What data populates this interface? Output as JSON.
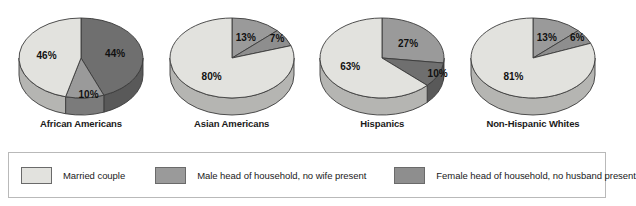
{
  "chart_data": {
    "type": "pie",
    "title": "",
    "layout": "four small-multiple 3D pie charts in a row with a shared legend below",
    "legend_position": "bottom",
    "grid": false,
    "value_format": "percent",
    "categories": [
      "Married couple",
      "Male head of household, no wife present",
      "Female head of household, no husband present"
    ],
    "category_colors": [
      "#e2e2de",
      "#9a9a9a",
      "#6f6f6f"
    ],
    "charts": [
      {
        "label": "African Americans",
        "slices": [
          {
            "category": "Female head of household, no husband present",
            "value": 44,
            "label": "44%",
            "color": "#6f6f6f"
          },
          {
            "category": "Male head of household, no wife present",
            "value": 10,
            "label": "10%",
            "color": "#9a9a9a"
          },
          {
            "category": "Married couple",
            "value": 46,
            "label": "46%",
            "color": "#e2e2de"
          }
        ]
      },
      {
        "label": "Asian Americans",
        "slices": [
          {
            "category": "Male head of household, no wife present",
            "value": 13,
            "label": "13%",
            "color": "#9a9a9a"
          },
          {
            "category": "Female head of household, no husband present",
            "value": 7,
            "label": "7%",
            "color": "#8e8e8e"
          },
          {
            "category": "Married couple",
            "value": 80,
            "label": "80%",
            "color": "#e2e2de"
          }
        ]
      },
      {
        "label": "Hispanics",
        "slices": [
          {
            "category": "Male head of household, no wife present",
            "value": 27,
            "label": "27%",
            "color": "#9a9a9a"
          },
          {
            "category": "Female head of household, no husband present",
            "value": 10,
            "label": "10%",
            "color": "#6f6f6f"
          },
          {
            "category": "Married couple",
            "value": 63,
            "label": "63%",
            "color": "#e2e2de"
          }
        ]
      },
      {
        "label": "Non-Hispanic Whites",
        "slices": [
          {
            "category": "Male head of household, no wife present",
            "value": 13,
            "label": "13%",
            "color": "#9a9a9a"
          },
          {
            "category": "Female head of household, no husband present",
            "value": 6,
            "label": "6%",
            "color": "#8e8e8e"
          },
          {
            "category": "Married couple",
            "value": 81,
            "label": "81%",
            "color": "#e2e2de"
          }
        ]
      }
    ]
  },
  "legend": {
    "items": [
      {
        "label": "Married couple",
        "color": "#e2e2de"
      },
      {
        "label": "Male head of household, no wife present",
        "color": "#9a9a9a"
      },
      {
        "label": "Female head of household, no husband present",
        "color": "#8e8e8e"
      }
    ]
  }
}
